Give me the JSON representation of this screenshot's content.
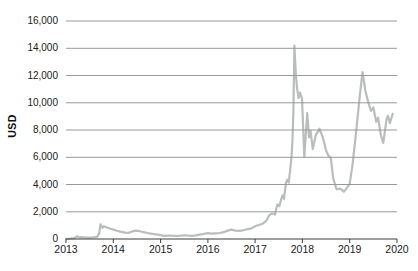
{
  "colors": {
    "background": "#ffffff",
    "grid": "#999999",
    "axis": "#3d3d3d",
    "text": "#1a1a1a",
    "line": "#b9bdbd"
  },
  "chart_data": {
    "type": "line",
    "title": "",
    "xlabel": "",
    "ylabel": "USD",
    "legend": "none",
    "grid": "horizontal",
    "xlim": [
      2013,
      2020
    ],
    "ylim": [
      0,
      16000
    ],
    "x_ticks": [
      "2013",
      "2014",
      "2015",
      "2016",
      "2017",
      "2018",
      "2019",
      "2020"
    ],
    "x_tick_values": [
      2013,
      2014,
      2015,
      2016,
      2017,
      2018,
      2019,
      2020
    ],
    "y_ticks": [
      "16,000",
      "14,000",
      "12,000",
      "10,000",
      "8,000",
      "6,000",
      "4,000",
      "2,000",
      "0"
    ],
    "y_tick_values": [
      16000,
      14000,
      12000,
      10000,
      8000,
      6000,
      4000,
      2000,
      0
    ],
    "series": [
      {
        "name": "Price in USD",
        "color": "#b9bdbd",
        "points": [
          [
            2013.0,
            15
          ],
          [
            2013.08,
            30
          ],
          [
            2013.17,
            60
          ],
          [
            2013.24,
            200
          ],
          [
            2013.28,
            120
          ],
          [
            2013.33,
            130
          ],
          [
            2013.4,
            110
          ],
          [
            2013.48,
            95
          ],
          [
            2013.56,
            110
          ],
          [
            2013.62,
            130
          ],
          [
            2013.66,
            170
          ],
          [
            2013.7,
            400
          ],
          [
            2013.73,
            1080
          ],
          [
            2013.77,
            830
          ],
          [
            2013.8,
            950
          ],
          [
            2013.84,
            870
          ],
          [
            2013.88,
            820
          ],
          [
            2013.94,
            750
          ],
          [
            2014.0,
            690
          ],
          [
            2014.08,
            600
          ],
          [
            2014.17,
            520
          ],
          [
            2014.25,
            470
          ],
          [
            2014.33,
            455
          ],
          [
            2014.4,
            560
          ],
          [
            2014.48,
            615
          ],
          [
            2014.56,
            575
          ],
          [
            2014.64,
            500
          ],
          [
            2014.72,
            440
          ],
          [
            2014.8,
            390
          ],
          [
            2014.9,
            345
          ],
          [
            2015.0,
            280
          ],
          [
            2015.08,
            225
          ],
          [
            2015.16,
            260
          ],
          [
            2015.24,
            245
          ],
          [
            2015.33,
            235
          ],
          [
            2015.42,
            250
          ],
          [
            2015.5,
            270
          ],
          [
            2015.58,
            255
          ],
          [
            2015.66,
            235
          ],
          [
            2015.75,
            265
          ],
          [
            2015.83,
            320
          ],
          [
            2015.92,
            385
          ],
          [
            2016.0,
            425
          ],
          [
            2016.08,
            400
          ],
          [
            2016.17,
            420
          ],
          [
            2016.25,
            440
          ],
          [
            2016.33,
            500
          ],
          [
            2016.42,
            620
          ],
          [
            2016.5,
            690
          ],
          [
            2016.58,
            620
          ],
          [
            2016.66,
            600
          ],
          [
            2016.75,
            640
          ],
          [
            2016.83,
            710
          ],
          [
            2016.92,
            780
          ],
          [
            2017.0,
            930
          ],
          [
            2017.08,
            1030
          ],
          [
            2017.16,
            1120
          ],
          [
            2017.24,
            1350
          ],
          [
            2017.3,
            1750
          ],
          [
            2017.36,
            1880
          ],
          [
            2017.42,
            1800
          ],
          [
            2017.47,
            2550
          ],
          [
            2017.51,
            2400
          ],
          [
            2017.55,
            2900
          ],
          [
            2017.58,
            3200
          ],
          [
            2017.61,
            2950
          ],
          [
            2017.65,
            4100
          ],
          [
            2017.68,
            4350
          ],
          [
            2017.71,
            4150
          ],
          [
            2017.74,
            5000
          ],
          [
            2017.77,
            6100
          ],
          [
            2017.79,
            7300
          ],
          [
            2017.81,
            9400
          ],
          [
            2017.83,
            14200
          ],
          [
            2017.86,
            12100
          ],
          [
            2017.89,
            11000
          ],
          [
            2017.92,
            10350
          ],
          [
            2017.95,
            10750
          ],
          [
            2017.99,
            10300
          ],
          [
            2018.04,
            6050
          ],
          [
            2018.1,
            9250
          ],
          [
            2018.14,
            7450
          ],
          [
            2018.17,
            7950
          ],
          [
            2018.22,
            6600
          ],
          [
            2018.28,
            7600
          ],
          [
            2018.36,
            8100
          ],
          [
            2018.43,
            7450
          ],
          [
            2018.5,
            6500
          ],
          [
            2018.55,
            6100
          ],
          [
            2018.6,
            5950
          ],
          [
            2018.65,
            4450
          ],
          [
            2018.72,
            3650
          ],
          [
            2018.8,
            3700
          ],
          [
            2018.88,
            3480
          ],
          [
            2018.95,
            3800
          ],
          [
            2019.0,
            4050
          ],
          [
            2019.06,
            5500
          ],
          [
            2019.13,
            7700
          ],
          [
            2019.2,
            10100
          ],
          [
            2019.27,
            12250
          ],
          [
            2019.33,
            10900
          ],
          [
            2019.4,
            9950
          ],
          [
            2019.45,
            9400
          ],
          [
            2019.5,
            9650
          ],
          [
            2019.56,
            8600
          ],
          [
            2019.6,
            8900
          ],
          [
            2019.66,
            7600
          ],
          [
            2019.71,
            7050
          ],
          [
            2019.78,
            8800
          ],
          [
            2019.81,
            9050
          ],
          [
            2019.85,
            8500
          ],
          [
            2019.91,
            9200
          ]
        ]
      }
    ]
  }
}
